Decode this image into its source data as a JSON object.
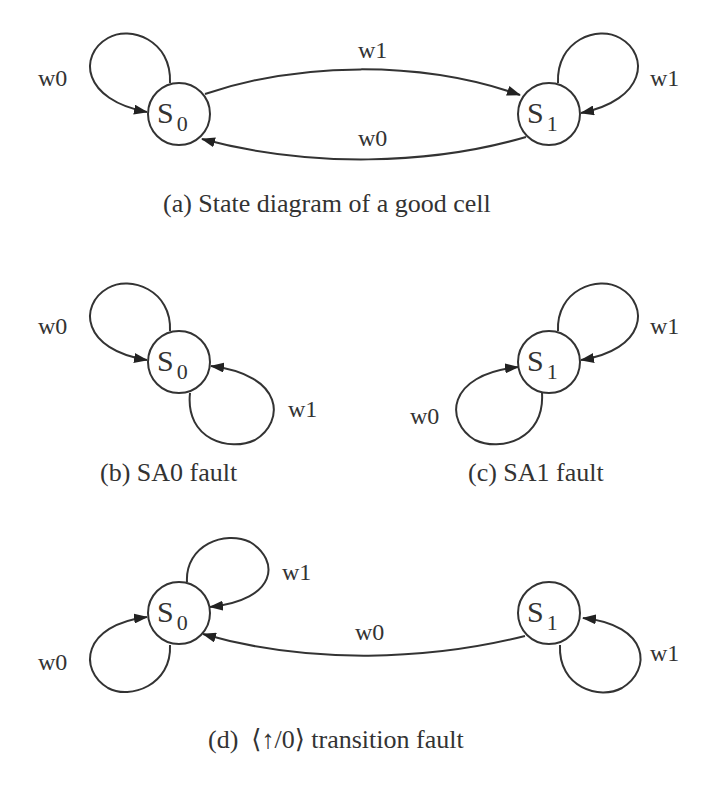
{
  "panels": {
    "a": {
      "caption": "(a) State diagram of a good cell",
      "states": [
        {
          "name": "S",
          "sub": "0"
        },
        {
          "name": "S",
          "sub": "1"
        }
      ],
      "edges": {
        "s0_self": "w0",
        "s0_to_s1": "w1",
        "s1_to_s0": "w0",
        "s1_self": "w1"
      }
    },
    "b": {
      "caption": "(b) SA0 fault",
      "states": [
        {
          "name": "S",
          "sub": "0"
        }
      ],
      "edges": {
        "s0_self_w0": "w0",
        "s0_self_w1": "w1"
      }
    },
    "c": {
      "caption": "(c) SA1 fault",
      "states": [
        {
          "name": "S",
          "sub": "1"
        }
      ],
      "edges": {
        "s1_self_w1": "w1",
        "s1_self_w0": "w0"
      }
    },
    "d": {
      "caption": "(d)  ⟨↑/0⟩ transition fault",
      "states": [
        {
          "name": "S",
          "sub": "0"
        },
        {
          "name": "S",
          "sub": "1"
        }
      ],
      "edges": {
        "s0_self_w1": "w1",
        "s0_self_w0": "w0",
        "s1_to_s0": "w0",
        "s1_self_w1": "w1"
      }
    }
  }
}
